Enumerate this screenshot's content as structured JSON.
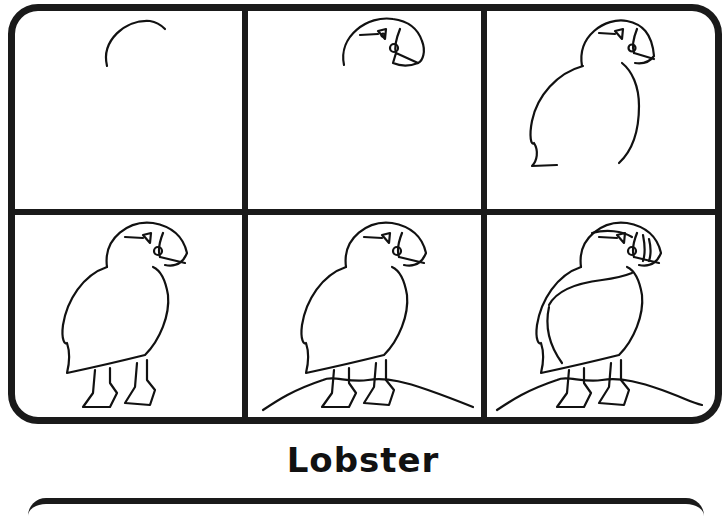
{
  "worksheet": {
    "title": "Lobster",
    "grid": {
      "rows": 2,
      "columns": 3
    },
    "panels": [
      {
        "step": 1,
        "content": "head-arc"
      },
      {
        "step": 2,
        "content": "head-with-eye-and-beak"
      },
      {
        "step": 3,
        "content": "head-and-body-outline"
      },
      {
        "step": 4,
        "content": "full-bird-with-feet"
      },
      {
        "step": 5,
        "content": "bird-on-rock"
      },
      {
        "step": 6,
        "content": "detailed-bird-on-rock"
      }
    ],
    "colors": {
      "ink": "#111111",
      "background": "#ffffff"
    }
  }
}
